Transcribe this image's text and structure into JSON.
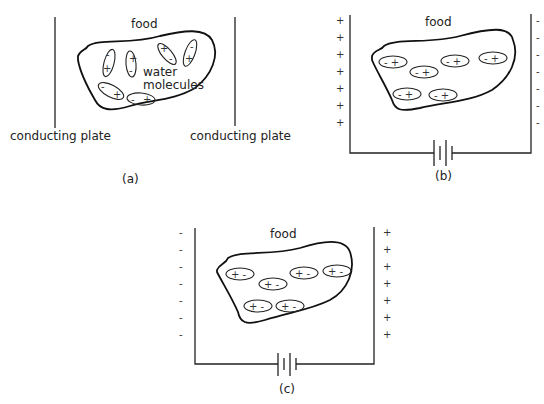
{
  "panels": {
    "a": {
      "caption": "(a)",
      "food_label": "food",
      "molecules_label_1": "water",
      "molecules_label_2": "molecules",
      "left_plate_label": "conducting plate",
      "right_plate_label": "conducting plate"
    },
    "b": {
      "caption": "(b)",
      "food_label": "food",
      "left_plate_sign": "+",
      "right_plate_sign": "-",
      "molecule_text": "- +"
    },
    "c": {
      "caption": "(c)",
      "food_label": "food",
      "left_plate_sign": "-",
      "right_plate_sign": "+",
      "molecule_text": "+ -"
    }
  }
}
